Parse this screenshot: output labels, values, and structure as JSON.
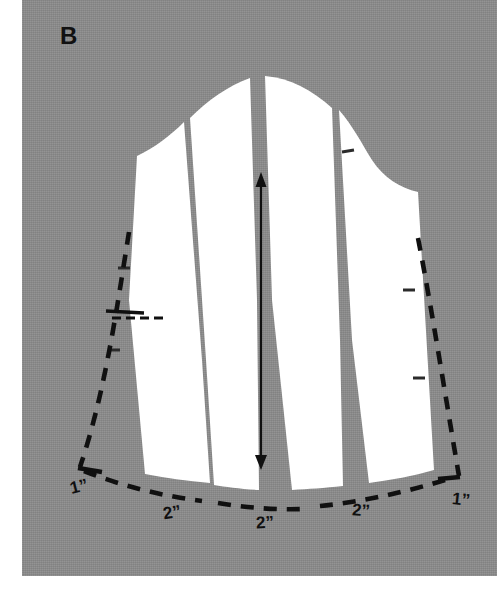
{
  "figure": {
    "plate_label": "B",
    "caption_visible": false,
    "background_color": "#8a8a8a",
    "pattern_color": "#ffffff",
    "line_color": "#101010",
    "margin_color": "#ffffff"
  },
  "pattern": {
    "type": "sleeve-cap-slash-and-spread",
    "panels_count": 4,
    "slashes_count": 3,
    "grainline": {
      "name": "grainline-arrow",
      "double_headed": true,
      "top_y": 176,
      "bottom_y": 468
    }
  },
  "dimensions": [
    {
      "id": "left-edge-spread",
      "value": "1”",
      "x": 70,
      "y": 486
    },
    {
      "id": "left-inner-spread",
      "value": "2”",
      "x": 163,
      "y": 512
    },
    {
      "id": "center-spread",
      "value": "2”",
      "x": 256,
      "y": 522
    },
    {
      "id": "right-inner-spread",
      "value": "2”",
      "x": 352,
      "y": 510
    },
    {
      "id": "right-edge-spread",
      "value": "1”",
      "x": 452,
      "y": 500
    }
  ],
  "notches": [
    {
      "id": "cap-right-notch",
      "x": 348,
      "y": 152
    },
    {
      "id": "left-upper-notch",
      "x": 122,
      "y": 268
    },
    {
      "id": "left-lower-notch",
      "x": 112,
      "y": 350
    },
    {
      "id": "right-upper-notch",
      "x": 409,
      "y": 290
    },
    {
      "id": "right-lower-notch",
      "x": 419,
      "y": 378
    }
  ],
  "guide_marks": [
    {
      "id": "left-dart-guide",
      "x1": 106,
      "y1": 312,
      "x2": 165,
      "y2": 318
    }
  ]
}
